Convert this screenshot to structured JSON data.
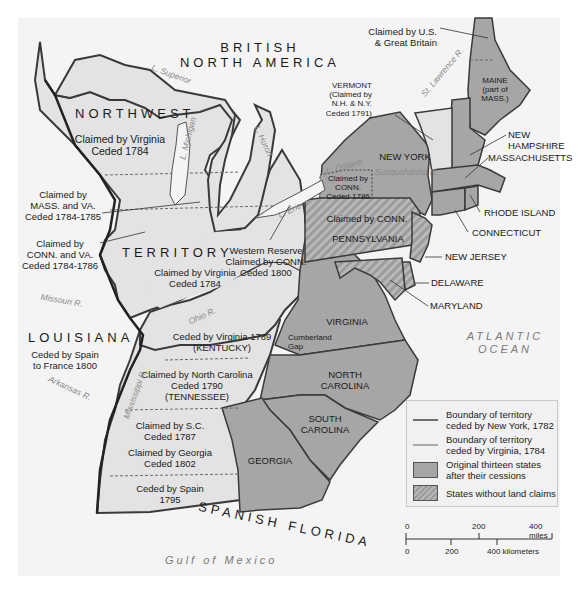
{
  "map": {
    "regions": {
      "british_north_america": "BRITISH\nNORTH AMERICA",
      "northwest": "NORTHWEST",
      "territory": "TERRITORY",
      "louisiana": "LOUISIANA",
      "spanish_florida": "SPANISH FLORIDA"
    },
    "labels": {
      "nw_virginia": [
        "Claimed by Virginia",
        "Ceded 1784"
      ],
      "mass_va": [
        "Claimed by",
        "MASS. and VA.",
        "Ceded 1784-1785"
      ],
      "conn_va": [
        "Claimed by",
        "CONN. and VA.",
        "Ceded 1784-1786"
      ],
      "ohio_virginia": [
        "Claimed by Virginia",
        "Ceded 1784"
      ],
      "western_reserve": [
        "Western Reserve",
        "Claimed by CONN.",
        "Ceded 1800"
      ],
      "louisiana_ceded": [
        "Ceded by Spain",
        "to France 1800"
      ],
      "kentucky": [
        "Ceded by Virginia 1789",
        "(KENTUCKY)"
      ],
      "tennessee": [
        "Claimed by North Carolina",
        "Ceded 1790",
        "(TENNESSEE)"
      ],
      "sc_claim": [
        "Claimed by S.C.",
        "Ceded 1787"
      ],
      "georgia_claim": [
        "Claimed by Georgia",
        "Ceded 1802"
      ],
      "spain_1795": [
        "Ceded by Spain",
        "1795"
      ],
      "us_gb": [
        "Claimed by U.S.",
        "& Great Britain"
      ],
      "vermont": [
        "VERMONT",
        "(Claimed by",
        "N.H. & N.Y.",
        "Ceded 1791)"
      ],
      "maine": [
        "MAINE",
        "(part of",
        "MASS.)"
      ],
      "new_hampshire": [
        "NEW",
        "HAMPSHIRE"
      ],
      "massachusetts": "MASSACHUSETTS",
      "new_york": "NEW YORK",
      "conn_claim_ny": [
        "Claimed by",
        "CONN.",
        "Ceded 1786"
      ],
      "conn_claim_pa": "Claimed by CONN.",
      "pennsylvania": "PENNSYLVANIA",
      "rhode_island": "RHODE ISLAND",
      "connecticut": "CONNECTICUT",
      "new_jersey": "NEW JERSEY",
      "delaware": "DELAWARE",
      "maryland": "MARYLAND",
      "virginia": "VIRGINIA",
      "cumberland_gap": [
        "Cumberland",
        "Gap"
      ],
      "north_carolina": [
        "NORTH",
        "CAROLINA"
      ],
      "south_carolina": [
        "SOUTH",
        "CAROLINA"
      ],
      "georgia": "GEORGIA"
    },
    "water": {
      "superior": "L. Superior",
      "michigan": "L. Michigan",
      "huron": "L. Huron",
      "ontario": "L. Ontario",
      "erie": "L. Erie",
      "st_lawrence": "St. Lawrence R.",
      "susquehanna": "Susquehanna R.",
      "missouri": "Missouri R.",
      "ohio": "Ohio R.",
      "arkansas": "Arkansas R.",
      "mississippi": "Mississippi R.",
      "gulf": "Gulf of Mexico",
      "atlantic": [
        "ATLANTIC",
        "OCEAN"
      ]
    },
    "colors": {
      "background": "#f4f4f4",
      "territory_fill": "#e3e3e3",
      "state_fill": "#a6a6a6",
      "hatch_dark": "#9c9c9c",
      "hatch_light": "#b9b9b9",
      "ny_boundary": "#5a5a5a",
      "va_boundary": "#9a9a9a",
      "border": "#3a3a3a"
    }
  },
  "legend": {
    "items": [
      {
        "type": "line-ny",
        "label": "Boundary of territory\nceded by New York, 1782"
      },
      {
        "type": "line-va",
        "label": "Boundary of territory\nceded by Virginia, 1784"
      },
      {
        "type": "fill",
        "label": "Original thirteen states\nafter their cessions"
      },
      {
        "type": "hatch",
        "label": "States without land claims"
      }
    ]
  },
  "scale": {
    "miles_ticks": [
      "0",
      "200",
      "400 miles"
    ],
    "km_ticks": [
      "0",
      "200",
      "400 kilometers"
    ]
  }
}
